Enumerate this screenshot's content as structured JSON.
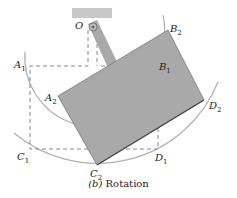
{
  "figure": {
    "caption_letter": "(b)",
    "caption_text": "Rotation",
    "labels": {
      "O": "O",
      "A1": "A",
      "A1_sub": "1",
      "A2": "A",
      "A2_sub": "2",
      "B1": "B",
      "B1_sub": "1",
      "B2": "B",
      "B2_sub": "2",
      "C1": "C",
      "C1_sub": "1",
      "C2": "C",
      "C2_sub": "2",
      "D1": "D",
      "D1_sub": "1",
      "D2": "D",
      "D2_sub": "2"
    },
    "colors": {
      "plate": "#a9a9a9",
      "plate_edge": "#555555",
      "arc": "#b0b0b0",
      "dashed": "#888888",
      "support": "#c8c8c8"
    }
  }
}
